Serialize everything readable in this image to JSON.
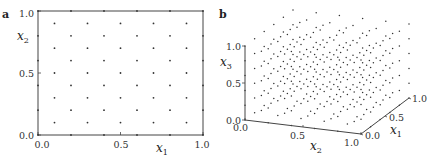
{
  "chart_data": [
    {
      "panel_label": "a",
      "type": "scatter",
      "title": "",
      "xlabel": "x",
      "xlabel_sub": "1",
      "ylabel": "x",
      "ylabel_sub": "2",
      "xlim": [
        0.0,
        1.0
      ],
      "ylim": [
        0.0,
        1.0
      ],
      "xticks": [
        "0.0",
        "0.5",
        "1.0"
      ],
      "yticks": [
        "0.0",
        "0.5",
        "1.0"
      ],
      "grid": false,
      "description": "Body-centered 2D lattice: points at (i*0.2, j*0.2) for i,j in 0..5 and at (0.1+i*0.2, 0.1+j*0.2) for i,j in 0..4",
      "lattice": {
        "spacing": 0.2,
        "even_offset": 0.0,
        "odd_offset": 0.1
      }
    },
    {
      "panel_label": "b",
      "type": "scatter",
      "title": "",
      "projection": "3d",
      "xlabel": "x",
      "xlabel_sub": "1",
      "ylabel": "x",
      "ylabel_sub": "2",
      "zlabel": "x",
      "zlabel_sub": "3",
      "x1lim": [
        0.0,
        1.0
      ],
      "x2lim": [
        0.0,
        1.0
      ],
      "x3lim": [
        0.0,
        1.0
      ],
      "x1ticks": [
        "0.0",
        "0.5",
        "1.0"
      ],
      "x2ticks": [
        "0.0",
        "0.5",
        "1.0"
      ],
      "x3ticks": [
        "0.0",
        "0.5",
        "1.0"
      ],
      "grid": false,
      "description": "Body-centered cubic lattice in the unit cube: points at multiples of 0.2 plus centers offset by 0.1",
      "lattice": {
        "spacing": 0.2,
        "even_offset": 0.0,
        "odd_offset": 0.1
      }
    }
  ]
}
